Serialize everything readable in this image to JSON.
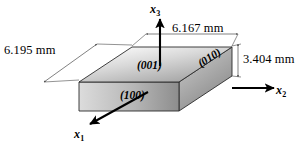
{
  "figure": {
    "type": "crystal-slab-diagram",
    "background_color": "#ffffff",
    "dimensions": {
      "left": "6.195 mm",
      "top": "6.167 mm",
      "right": "3.404 mm"
    },
    "planes": {
      "top": "(001)",
      "front": "(100)",
      "right": "(010)"
    },
    "axes": {
      "x1": {
        "symbol": "x",
        "subscript": "1"
      },
      "x2": {
        "symbol": "x",
        "subscript": "2"
      },
      "x3": {
        "symbol": "x",
        "subscript": "3"
      }
    },
    "colors": {
      "line": "#000000",
      "dimension_line": "#4a4a4a",
      "face_top_light": "#fdfdfd",
      "face_top_dark": "#9a9a9a",
      "face_front_light": "#d6d6d6",
      "face_front_dark": "#8f8f8f",
      "face_right_light": "#c9c9c9",
      "face_right_dark": "#8a8a8a"
    }
  }
}
